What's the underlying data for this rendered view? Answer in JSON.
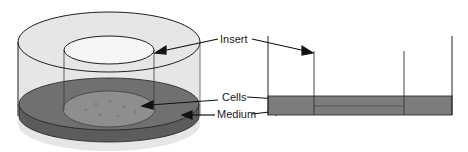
{
  "labels": {
    "insert": "Insert",
    "cells": "Cells",
    "medium": "Medium"
  },
  "colors": {
    "outer_wall": "#e4e4e4",
    "insert_top": "#f4f4f4",
    "medium_top": "#6e6e6e",
    "medium_side": "#5a5a5a",
    "cells_layer": "#8c8c8c",
    "outline": "#1e1e1e",
    "cross_section_medium": "#7a7a7a"
  }
}
